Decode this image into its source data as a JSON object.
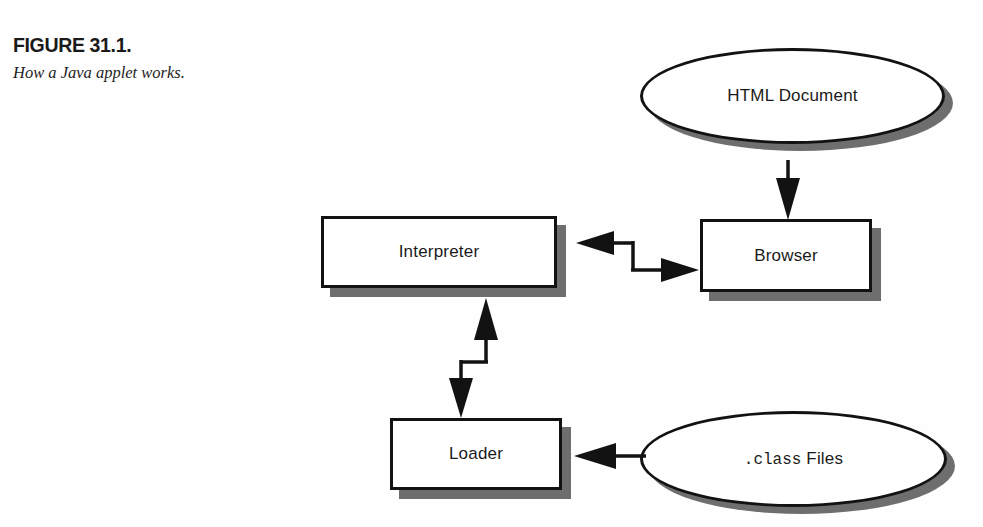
{
  "figure": {
    "number": "FIGURE 31.1.",
    "caption": "How a Java applet works.",
    "top_cut_text": ""
  },
  "colors": {
    "outline": "#121212",
    "shadow": "#6e6e6e",
    "face": "#ffffff",
    "text": "#1b1b1b",
    "background": "#fefefe"
  },
  "nodes": {
    "html_document": {
      "label": "HTML Document",
      "shape": "ellipse"
    },
    "browser": {
      "label": "Browser",
      "shape": "rectangle"
    },
    "interpreter": {
      "label": "Interpreter",
      "shape": "rectangle"
    },
    "loader": {
      "label": "Loader",
      "shape": "rectangle"
    },
    "class_files": {
      "label": ".class Files",
      "shape": "ellipse",
      "label_mono": ".class",
      "label_sans": " Files"
    }
  },
  "arrows": [
    {
      "name": "html-document-to-browser",
      "from": "html_document",
      "to": "browser",
      "style": "straight-vertical",
      "direction": "down"
    },
    {
      "name": "interpreter-browser-bidirectional",
      "from": "interpreter",
      "to": "browser",
      "style": "z-horizontal",
      "direction": "both"
    },
    {
      "name": "interpreter-loader-bidirectional",
      "from": "interpreter",
      "to": "loader",
      "style": "z-vertical",
      "direction": "both"
    },
    {
      "name": "class-files-to-loader",
      "from": "class_files",
      "to": "loader",
      "style": "straight-horizontal",
      "direction": "left"
    }
  ]
}
